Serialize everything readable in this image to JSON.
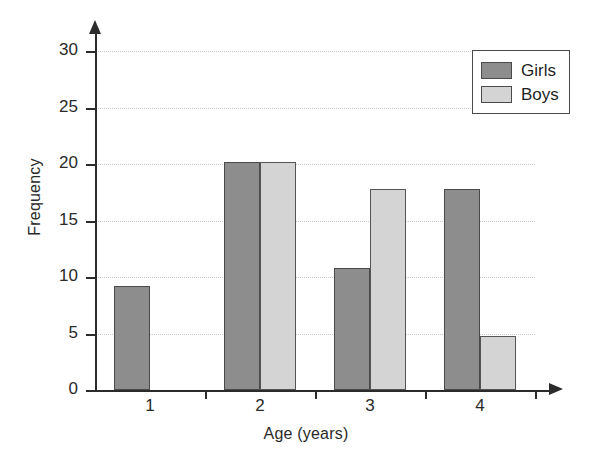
{
  "chart_data": {
    "type": "bar",
    "title": "",
    "xlabel": "Age (years)",
    "ylabel": "Frequency",
    "categories": [
      "1",
      "2",
      "3",
      "4"
    ],
    "series": [
      {
        "name": "Girls",
        "color": "#8d8d8d",
        "values": [
          9.2,
          20.2,
          10.8,
          17.8
        ]
      },
      {
        "name": "Boys",
        "color": "#d4d4d4",
        "values": [
          0,
          20.2,
          17.8,
          4.8
        ]
      }
    ],
    "ylim": [
      0,
      31
    ],
    "yticks": [
      0,
      5,
      10,
      15,
      20,
      25,
      30
    ],
    "ytick_labels": [
      "0",
      "5",
      "10",
      "15",
      "20",
      "25",
      "30"
    ],
    "xtick_labels": [
      "1",
      "2",
      "3",
      "4"
    ],
    "grid": true,
    "grid_axis": "y",
    "legend_position": "top-right",
    "legend_entries": [
      "Girls",
      "Boys"
    ],
    "axis_arrows": true
  }
}
